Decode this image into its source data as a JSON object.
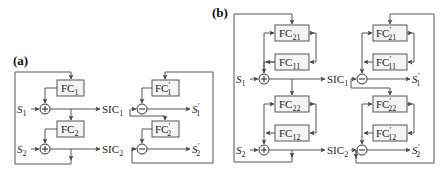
{
  "panel_a": {
    "label": "(a)",
    "fc": [
      {
        "base": "FC",
        "prime": "",
        "sub": "1"
      },
      {
        "base": "FC",
        "prime": "",
        "sub": "2"
      }
    ],
    "fc_prime": [
      {
        "base": "FC",
        "prime": "′",
        "sub": "1"
      },
      {
        "base": "FC",
        "prime": "′",
        "sub": "2"
      }
    ],
    "inputs": [
      {
        "base": "S",
        "sub": "1"
      },
      {
        "base": "S",
        "sub": "2"
      }
    ],
    "sic": [
      {
        "base": "SIC",
        "sub": "1"
      },
      {
        "base": "SIC",
        "sub": "2"
      }
    ],
    "outputs": [
      {
        "base": "S",
        "prime": "′",
        "sub": "1"
      },
      {
        "base": "S",
        "prime": "′",
        "sub": "2"
      }
    ],
    "adder_symbol": "+",
    "subtractor_symbol": "−"
  },
  "panel_b": {
    "label": "(b)",
    "fc_top": [
      {
        "base": "FC",
        "prime": "",
        "sub": "21"
      },
      {
        "base": "FC",
        "prime": "",
        "sub": "11"
      }
    ],
    "fc_bottom": [
      {
        "base": "FC",
        "prime": "",
        "sub": "22"
      },
      {
        "base": "FC",
        "prime": "",
        "sub": "12"
      }
    ],
    "fc_prime_top": [
      {
        "base": "FC",
        "prime": "′",
        "sub": "21"
      },
      {
        "base": "FC",
        "prime": "′",
        "sub": "11"
      }
    ],
    "fc_prime_bottom": [
      {
        "base": "FC",
        "prime": "′",
        "sub": "22"
      },
      {
        "base": "FC",
        "prime": "′",
        "sub": "12"
      }
    ],
    "inputs": [
      {
        "base": "S",
        "sub": "1"
      },
      {
        "base": "S",
        "sub": "2"
      }
    ],
    "sic": [
      {
        "base": "SIC",
        "sub": "1"
      },
      {
        "base": "SIC",
        "sub": "2"
      }
    ],
    "outputs": [
      {
        "base": "S",
        "prime": "′",
        "sub": "1"
      },
      {
        "base": "S",
        "prime": "′",
        "sub": "2"
      }
    ],
    "adder_symbol": "+",
    "subtractor_symbol": "−"
  },
  "colors": {
    "line": "#555555",
    "box_fill": "#f4f4f4",
    "text": "#222222"
  }
}
